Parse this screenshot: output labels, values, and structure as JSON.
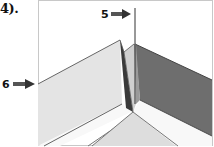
{
  "step": {
    "label": "4)."
  },
  "callouts": [
    {
      "id": "5",
      "label": "5",
      "target": "vertical-reference-line"
    },
    {
      "id": "6",
      "label": "6",
      "target": "left-board-edge"
    }
  ],
  "colors": {
    "frame_border": "#c8c8c8",
    "frame_background": "#ffffff",
    "board_light_face": "#e6e6e6",
    "board_top_white": "#f7f7f7",
    "board_dark_face": "#6e6e6e",
    "board_edge_line": "#555555",
    "center_sliver_dark": "#3a3a3a",
    "center_sliver_mid": "#9a9a9a",
    "arrow": "#333333",
    "bottom_floor": "#dcdcdc"
  }
}
